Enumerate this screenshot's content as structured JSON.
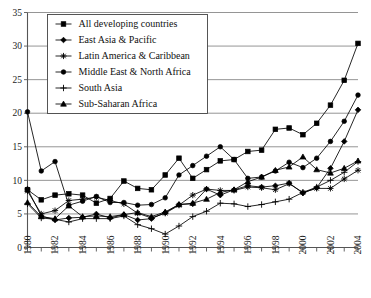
{
  "chart_data": {
    "type": "line",
    "title": "",
    "xlabel": "",
    "ylabel": "",
    "xlim": [
      1980,
      2004
    ],
    "ylim": [
      0,
      35
    ],
    "ytick_step": 5,
    "yticks": [
      "0",
      "5",
      "10",
      "15",
      "20",
      "25",
      "30",
      "35"
    ],
    "xticks": [
      "1980",
      "1982",
      "1984",
      "1986",
      "1988",
      "1990",
      "1992",
      "1994",
      "1996",
      "1998",
      "2000",
      "2002",
      "2004"
    ],
    "x": [
      1980,
      1981,
      1982,
      1983,
      1984,
      1985,
      1986,
      1987,
      1988,
      1989,
      1990,
      1991,
      1992,
      1993,
      1994,
      1995,
      1996,
      1997,
      1998,
      1999,
      2000,
      2001,
      2002,
      2003,
      2004
    ],
    "grid": "horizontal",
    "legend_position": "top-left",
    "series": [
      {
        "name": "All developing countries",
        "marker": "square",
        "values": [
          8.6,
          7.1,
          7.8,
          8.0,
          7.8,
          6.6,
          7.3,
          9.9,
          8.8,
          8.6,
          10.8,
          13.3,
          10.3,
          11.6,
          12.9,
          13.1,
          14.3,
          14.5,
          17.6,
          17.8,
          16.8,
          18.5,
          21.2,
          24.9,
          30.4
        ]
      },
      {
        "name": "East Asia & Pacific",
        "marker": "diamond",
        "values": [
          8.7,
          4.7,
          4.1,
          4.4,
          4.5,
          5.0,
          4.4,
          4.9,
          4.1,
          4.3,
          5.2,
          6.4,
          6.5,
          8.7,
          7.8,
          8.6,
          9.2,
          9.0,
          9.2,
          9.6,
          8.1,
          8.9,
          11.8,
          15.8,
          20.5
        ]
      },
      {
        "name": "Latin America & Caribbean",
        "marker": "asterisk",
        "values": [
          8.4,
          5.0,
          5.5,
          7.0,
          7.2,
          7.5,
          7.0,
          6.5,
          5.1,
          4.4,
          5.1,
          6.3,
          7.8,
          8.7,
          8.5,
          8.5,
          9.0,
          8.9,
          8.6,
          9.5,
          8.2,
          8.8,
          8.8,
          10.2,
          11.5
        ]
      },
      {
        "name": "Middle East & North Africa",
        "marker": "circle",
        "values": [
          20.2,
          11.4,
          12.8,
          6.3,
          6.9,
          7.6,
          6.7,
          6.7,
          6.3,
          6.4,
          7.4,
          10.8,
          12.2,
          13.6,
          15.0,
          13.1,
          10.3,
          10.5,
          11.4,
          12.7,
          11.9,
          13.3,
          15.8,
          18.8,
          22.7
        ]
      },
      {
        "name": "South Asia",
        "marker": "plus",
        "values": [
          6.5,
          4.4,
          4.2,
          3.8,
          4.3,
          4.3,
          4.3,
          4.7,
          3.4,
          2.8,
          2.0,
          3.2,
          4.6,
          5.4,
          6.6,
          6.5,
          6.1,
          6.4,
          6.8,
          7.2,
          8.2,
          9.0,
          10.0,
          11.2,
          12.8
        ]
      },
      {
        "name": "Sub-Saharan Africa",
        "marker": "triangle",
        "values": [
          6.7,
          4.6,
          4.3,
          6.2,
          4.6,
          4.7,
          4.6,
          4.9,
          5.2,
          4.6,
          5.3,
          6.4,
          6.6,
          7.2,
          8.2,
          8.6,
          9.8,
          10.5,
          11.5,
          12.0,
          13.5,
          11.6,
          11.1,
          11.8,
          12.9
        ]
      }
    ]
  },
  "legend": {
    "entries": [
      {
        "label": "All developing countries"
      },
      {
        "label": "East Asia & Pacific"
      },
      {
        "label": "Latin America & Caribbean"
      },
      {
        "label": "Middle East & North Africa"
      },
      {
        "label": "South Asia"
      },
      {
        "label": "Sub-Saharan Africa"
      }
    ]
  }
}
